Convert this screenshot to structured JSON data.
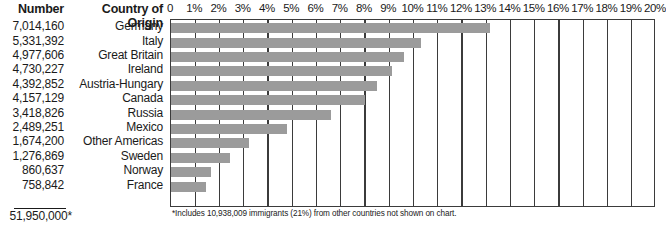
{
  "table": {
    "header_number": "Number",
    "header_country": "Country of Origin",
    "total": "51,950,000*"
  },
  "footnote": "*Includes 10,938,009 immigrants (21%) from other countries not shown on chart.",
  "colors": {
    "bar": "#9b9b9b",
    "axis": "#3b3b3b",
    "text": "#1a1a1a",
    "background": "#ffffff"
  },
  "chart_data": {
    "type": "bar",
    "title": "",
    "xlabel": "",
    "ylabel": "Country of Origin",
    "orientation": "horizontal",
    "xlim": [
      0,
      20
    ],
    "grid": true,
    "legend": null,
    "tick_labels": [
      "0",
      "1%",
      "2%",
      "3%",
      "4%",
      "5%",
      "6%",
      "7%",
      "8%",
      "9%",
      "10%",
      "11%",
      "12%",
      "13%",
      "14%",
      "15%",
      "16%",
      "17%",
      "18%",
      "19%",
      "20%"
    ],
    "tick_values": [
      0,
      1,
      2,
      3,
      4,
      5,
      6,
      7,
      8,
      9,
      10,
      11,
      12,
      13,
      14,
      15,
      16,
      17,
      18,
      19,
      20
    ],
    "categories": [
      "Germany",
      "Italy",
      "Great Britain",
      "Ireland",
      "Austria-Hungary",
      "Canada",
      "Russia",
      "Mexico",
      "Other Americas",
      "Sweden",
      "Norway",
      "France"
    ],
    "values": [
      13.15,
      10.3,
      9.6,
      9.1,
      8.5,
      8.0,
      6.6,
      4.8,
      3.2,
      2.45,
      1.65,
      1.45
    ],
    "counts": [
      "7,014,160",
      "5,331,392",
      "4,977,606",
      "4,730,227",
      "4,392,852",
      "4,157,129",
      "3,418,826",
      "2,489,251",
      "1,674,200",
      "1,276,869",
      "860,637",
      "758,842"
    ],
    "rows": [
      {
        "country": "Germany",
        "number": "7,014,160",
        "percent": 13.15
      },
      {
        "country": "Italy",
        "number": "5,331,392",
        "percent": 10.3
      },
      {
        "country": "Great Britain",
        "number": "4,977,606",
        "percent": 9.6
      },
      {
        "country": "Ireland",
        "number": "4,730,227",
        "percent": 9.1
      },
      {
        "country": "Austria-Hungary",
        "number": "4,392,852",
        "percent": 8.5
      },
      {
        "country": "Canada",
        "number": "4,157,129",
        "percent": 8.0
      },
      {
        "country": "Russia",
        "number": "3,418,826",
        "percent": 6.6
      },
      {
        "country": "Mexico",
        "number": "2,489,251",
        "percent": 4.8
      },
      {
        "country": "Other Americas",
        "number": "1,674,200",
        "percent": 3.2
      },
      {
        "country": "Sweden",
        "number": "1,276,869",
        "percent": 2.45
      },
      {
        "country": "Norway",
        "number": "860,637",
        "percent": 1.65
      },
      {
        "country": "France",
        "number": "758,842",
        "percent": 1.45
      }
    ]
  }
}
